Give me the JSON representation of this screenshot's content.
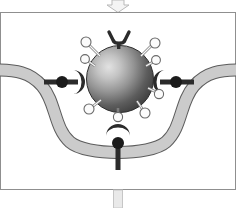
{
  "figure": {
    "title": "Receptor-mediated endocytosis stage",
    "canvas": {
      "width": 236,
      "height": 208
    },
    "background_color": "#ffffff"
  },
  "frame": {
    "panel_border_color": "#8a8a8a",
    "panel_top_y": 12,
    "panel_bottom_y": 190,
    "panel_fill": "#ffffff"
  },
  "top_arrow": {
    "name": "down-arrow",
    "direction": "down",
    "outline_color": "#b5b5b5",
    "fill_color": "#f2f2f2",
    "center_x": 118,
    "top_y": 0,
    "bottom_y": 12
  },
  "bottom_connector": {
    "name": "connector-bar",
    "outline_color": "#c8c8c8",
    "fill_color": "#e8e8e8",
    "center_x": 118,
    "top_y": 190,
    "bottom_y": 208,
    "width": 9
  },
  "membrane": {
    "name": "plasma-membrane",
    "shape": "invaginated-pit",
    "band_fill": "#c9c9c9",
    "band_outline": "#5a5a5a",
    "band_thickness": 9,
    "left_edge_y": 72,
    "pit_bottom_y": 152,
    "pit_left_x": 62,
    "pit_right_x": 176
  },
  "particle": {
    "name": "virus-particle",
    "shape": "sphere",
    "center_x": 120,
    "center_y": 79,
    "radius": 33,
    "gradient_highlight": "#dedede",
    "gradient_mid": "#8c8c8c",
    "gradient_edge": "#3c3c3c",
    "outline_color": "#2e2e2e"
  },
  "ligands": {
    "name": "surface-ligands",
    "tip_fill": "#fbfbfb",
    "tip_outline": "#6a6a6a",
    "stalk_color": "#f5f5f5",
    "stalk_outline": "#7d7d7d",
    "count": 8,
    "angles_deg": [
      208,
      240,
      300,
      332,
      152,
      120,
      60,
      28
    ]
  },
  "spike": {
    "name": "y-shaped-spike",
    "color": "#2b2b2b",
    "position": "top",
    "anchor_x": 120,
    "anchor_y": 46
  },
  "receptors": [
    {
      "name": "receptor-left",
      "side": "left",
      "cup_color": "#2b2b2b",
      "knob_color": "#1f1f1f",
      "stem_color": "#2b2b2b",
      "knob_x": 62,
      "knob_y": 82
    },
    {
      "name": "receptor-right",
      "side": "right",
      "cup_color": "#2b2b2b",
      "knob_color": "#1f1f1f",
      "stem_color": "#2b2b2b",
      "knob_x": 176,
      "knob_y": 82
    },
    {
      "name": "receptor-bottom",
      "side": "bottom",
      "cup_color": "#2b2b2b",
      "knob_color": "#1f1f1f",
      "stem_color": "#2b2b2b",
      "knob_x": 118,
      "knob_y": 143
    }
  ]
}
